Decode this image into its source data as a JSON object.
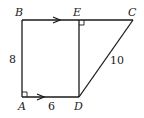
{
  "diagram": {
    "type": "geometry-trapezoid",
    "points": {
      "A": {
        "label": "A"
      },
      "B": {
        "label": "B"
      },
      "C": {
        "label": "C"
      },
      "D": {
        "label": "D"
      },
      "E": {
        "label": "E"
      }
    },
    "side_labels": {
      "AB": "8",
      "AD": "6",
      "DC": "10"
    },
    "right_angles": [
      "A",
      "E"
    ],
    "parallel_marks": [
      "BE",
      "AD"
    ]
  }
}
